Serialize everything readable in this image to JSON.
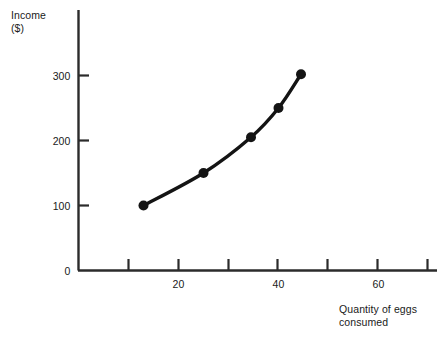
{
  "chart_data": {
    "type": "line",
    "title": "",
    "subtitle": "",
    "xlabel": "Quantity of eggs\nconsumed",
    "ylabel": "Income\n($)",
    "xlim": [
      0,
      72
    ],
    "ylim": [
      0,
      400
    ],
    "grid": false,
    "legend": null,
    "legend_position": "none",
    "x_tick_labels": [
      "20",
      "40",
      "60"
    ],
    "x_tick_values": [
      20,
      40,
      60
    ],
    "x_minor_tick_values": [
      10,
      20,
      30,
      40,
      50,
      60,
      70
    ],
    "y_tick_labels": [
      "0",
      "100",
      "200",
      "300"
    ],
    "y_tick_values": [
      0,
      100,
      200,
      300
    ],
    "series": [
      {
        "name": "Engel curve for eggs",
        "x": [
          13,
          25,
          34.5,
          40,
          44.5
        ],
        "values": [
          100,
          150,
          205,
          250,
          302
        ],
        "color": "#141414",
        "marker": "circle",
        "line_width": 3.4,
        "marker_size": 5
      }
    ],
    "annotations": []
  },
  "axes": {
    "y_axis_name": "income-axis",
    "x_axis_name": "quantity-axis",
    "axis_color": "#2b2b2b"
  }
}
